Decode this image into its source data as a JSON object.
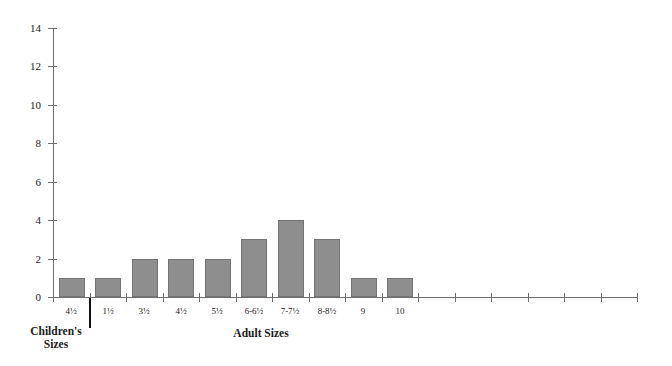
{
  "chart_data": {
    "type": "bar",
    "title": "",
    "categories": [
      "4½",
      "1½",
      "3½",
      "4½",
      "5½",
      "6-6½",
      "7-7½",
      "8-8½",
      "9",
      "10"
    ],
    "values": [
      1,
      1,
      2,
      2,
      2,
      3,
      4,
      3,
      1,
      1
    ],
    "y_ticks": [
      0,
      2,
      4,
      6,
      8,
      10,
      12,
      14
    ],
    "ylim": [
      0,
      14
    ],
    "xlabel": "",
    "ylabel": "",
    "grid": false,
    "legend": "none",
    "empty_trailing_slots": 6,
    "group_labels": [
      {
        "text": "Children's Sizes",
        "span_categories": [
          "4½"
        ]
      },
      {
        "text": "Adult Sizes",
        "span_categories": [
          "1½",
          "3½",
          "4½",
          "5½",
          "6-6½",
          "7-7½",
          "8-8½",
          "9",
          "10"
        ]
      }
    ],
    "colors": {
      "bar_fill": "#8e8e8e",
      "bar_border": "#747474",
      "axis": "#6e6e6e",
      "text": "#1c1c1c",
      "separator": "#111111"
    }
  }
}
